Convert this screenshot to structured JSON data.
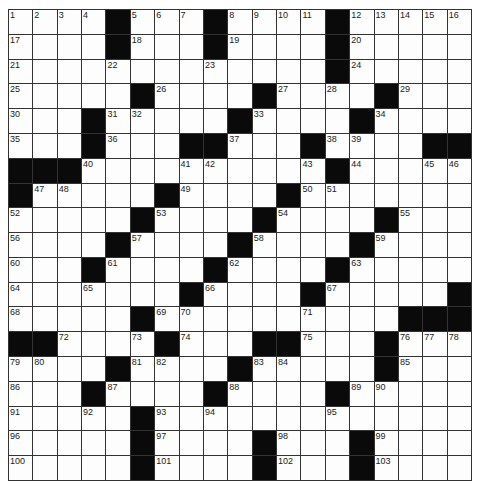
{
  "puzzle": {
    "rows": 19,
    "cols": 19,
    "black_cells": {
      "0": [
        4,
        8,
        13
      ],
      "1": [
        4,
        8,
        13
      ],
      "2": [
        13
      ],
      "3": [
        5,
        10,
        15
      ],
      "4": [
        3,
        9,
        14
      ],
      "5": [
        3,
        7,
        8,
        12,
        17,
        18
      ],
      "6": [
        0,
        1,
        2,
        13
      ],
      "7": [
        0,
        6,
        11
      ],
      "8": [
        5,
        10,
        15
      ],
      "9": [
        4,
        9,
        14
      ],
      "10": [
        3,
        8,
        13
      ],
      "11": [
        7,
        12,
        18
      ],
      "12": [
        5,
        16,
        17,
        18
      ],
      "13": [
        0,
        1,
        6,
        10,
        11,
        15
      ],
      "14": [
        4,
        9,
        15
      ],
      "15": [
        3,
        8,
        13
      ],
      "16": [
        5
      ],
      "17": [
        5,
        10,
        14
      ],
      "18": [
        5,
        10,
        14
      ]
    },
    "numbers": [
      [
        0,
        0,
        1
      ],
      [
        0,
        1,
        2
      ],
      [
        0,
        2,
        3
      ],
      [
        0,
        3,
        4
      ],
      [
        0,
        5,
        5
      ],
      [
        0,
        6,
        6
      ],
      [
        0,
        7,
        7
      ],
      [
        0,
        9,
        8
      ],
      [
        0,
        10,
        9
      ],
      [
        0,
        11,
        10
      ],
      [
        0,
        12,
        11
      ],
      [
        0,
        14,
        12
      ],
      [
        0,
        15,
        13
      ],
      [
        0,
        16,
        14
      ],
      [
        0,
        17,
        15
      ],
      [
        0,
        18,
        16
      ],
      [
        1,
        0,
        17
      ],
      [
        1,
        5,
        18
      ],
      [
        1,
        9,
        19
      ],
      [
        1,
        14,
        20
      ],
      [
        2,
        0,
        21
      ],
      [
        2,
        4,
        22
      ],
      [
        2,
        8,
        23
      ],
      [
        2,
        14,
        24
      ],
      [
        3,
        0,
        25
      ],
      [
        3,
        6,
        26
      ],
      [
        3,
        11,
        27
      ],
      [
        3,
        13,
        28
      ],
      [
        3,
        16,
        29
      ],
      [
        4,
        0,
        30
      ],
      [
        4,
        4,
        31
      ],
      [
        4,
        5,
        32
      ],
      [
        4,
        10,
        33
      ],
      [
        4,
        15,
        34
      ],
      [
        5,
        0,
        35
      ],
      [
        5,
        4,
        36
      ],
      [
        5,
        9,
        37
      ],
      [
        5,
        13,
        38
      ],
      [
        5,
        14,
        39
      ],
      [
        6,
        3,
        40
      ],
      [
        6,
        7,
        41
      ],
      [
        6,
        8,
        42
      ],
      [
        6,
        12,
        43
      ],
      [
        6,
        14,
        44
      ],
      [
        6,
        17,
        45
      ],
      [
        6,
        18,
        46
      ],
      [
        7,
        1,
        47
      ],
      [
        7,
        2,
        48
      ],
      [
        7,
        7,
        49
      ],
      [
        7,
        12,
        50
      ],
      [
        7,
        13,
        51
      ],
      [
        8,
        0,
        52
      ],
      [
        8,
        6,
        53
      ],
      [
        8,
        11,
        54
      ],
      [
        8,
        16,
        55
      ],
      [
        9,
        0,
        56
      ],
      [
        9,
        5,
        57
      ],
      [
        9,
        10,
        58
      ],
      [
        9,
        15,
        59
      ],
      [
        10,
        0,
        60
      ],
      [
        10,
        4,
        61
      ],
      [
        10,
        9,
        62
      ],
      [
        10,
        14,
        63
      ],
      [
        11,
        0,
        64
      ],
      [
        11,
        3,
        65
      ],
      [
        11,
        8,
        66
      ],
      [
        11,
        13,
        67
      ],
      [
        12,
        0,
        68
      ],
      [
        12,
        6,
        69
      ],
      [
        12,
        7,
        70
      ],
      [
        12,
        12,
        71
      ],
      [
        13,
        2,
        72
      ],
      [
        13,
        5,
        73
      ],
      [
        13,
        7,
        74
      ],
      [
        13,
        12,
        75
      ],
      [
        13,
        16,
        76
      ],
      [
        13,
        17,
        77
      ],
      [
        13,
        18,
        78
      ],
      [
        14,
        0,
        79
      ],
      [
        14,
        1,
        80
      ],
      [
        14,
        5,
        81
      ],
      [
        14,
        6,
        82
      ],
      [
        14,
        10,
        83
      ],
      [
        14,
        11,
        84
      ],
      [
        14,
        16,
        85
      ],
      [
        15,
        0,
        86
      ],
      [
        15,
        4,
        87
      ],
      [
        15,
        9,
        88
      ],
      [
        15,
        14,
        89
      ],
      [
        15,
        15,
        90
      ],
      [
        16,
        0,
        91
      ],
      [
        16,
        3,
        92
      ],
      [
        16,
        6,
        93
      ],
      [
        16,
        8,
        94
      ],
      [
        16,
        13,
        95
      ],
      [
        17,
        0,
        96
      ],
      [
        17,
        6,
        97
      ],
      [
        17,
        11,
        98
      ],
      [
        17,
        15,
        99
      ],
      [
        18,
        0,
        100
      ],
      [
        18,
        6,
        101
      ],
      [
        18,
        11,
        102
      ],
      [
        18,
        15,
        103
      ]
    ]
  },
  "colors": {
    "black_cell": "#0a0a0a",
    "white_cell": "#fdfdfd",
    "grid_line": "#333333"
  }
}
